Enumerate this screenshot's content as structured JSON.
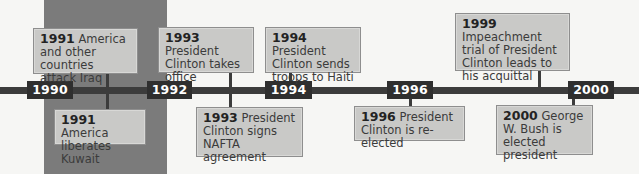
{
  "timeline": {
    "band": {
      "from": "1990",
      "to": "1992",
      "color": "#7b7b7b"
    },
    "axis_color": "#3c3c3c",
    "years": [
      {
        "label": "1990"
      },
      {
        "label": "1992"
      },
      {
        "label": "1994"
      },
      {
        "label": "1996"
      },
      {
        "label": "2000"
      }
    ],
    "events": [
      {
        "year": "1991",
        "text": "America and other countries attack Iraq",
        "position": "above"
      },
      {
        "year": "1991",
        "text": "America liberates Kuwait",
        "position": "below"
      },
      {
        "year": "1993",
        "text": "President Clinton takes office",
        "position": "above"
      },
      {
        "year": "1993",
        "text": "President Clinton signs NAFTA agreement",
        "position": "below"
      },
      {
        "year": "1994",
        "text": "President Clinton sends troops to Haiti",
        "position": "above"
      },
      {
        "year": "1996",
        "text": "President Clinton is re-elected",
        "position": "below"
      },
      {
        "year": "1999",
        "text": "Impeachment trial of President Clinton leads to his acquittal",
        "position": "above"
      },
      {
        "year": "2000",
        "text": "George W. Bush is elected president",
        "position": "below"
      }
    ]
  }
}
